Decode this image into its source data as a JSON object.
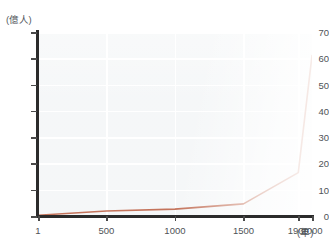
{
  "chart_data": {
    "type": "line",
    "title": "",
    "xlabel": "(年)",
    "ylabel": "(億人)",
    "xlim": [
      1,
      2000
    ],
    "ylim": [
      0,
      70
    ],
    "grid": true,
    "legend": "none",
    "x_ticks": [
      {
        "value": 1,
        "label": "1"
      },
      {
        "value": 500,
        "label": "500"
      },
      {
        "value": 1000,
        "label": "1000"
      },
      {
        "value": 1500,
        "label": "1500"
      },
      {
        "value": 1900,
        "label": "1900"
      },
      {
        "value": 2000,
        "label": "2000"
      }
    ],
    "y_ticks": [
      {
        "value": 0,
        "label": "0"
      },
      {
        "value": 10,
        "label": "10"
      },
      {
        "value": 20,
        "label": "20"
      },
      {
        "value": 30,
        "label": "30"
      },
      {
        "value": 40,
        "label": "40"
      },
      {
        "value": 50,
        "label": "50"
      },
      {
        "value": 60,
        "label": "60"
      },
      {
        "value": 70,
        "label": "70"
      }
    ],
    "series": [
      {
        "name": "世界人口",
        "color": "#c4745c",
        "x": [
          1,
          500,
          1000,
          1500,
          1900,
          2000
        ],
        "values": [
          0.3,
          1.9,
          2.6,
          4.6,
          16.5,
          61.0
        ]
      }
    ]
  },
  "axis": {
    "y_unit_caption": "(億人)",
    "x_unit_caption": "(年)"
  },
  "colors": {
    "line": "#c4745c",
    "plot_background": "#e9edf0",
    "gridline": "#ffffff",
    "axis": "#2b2b2b",
    "tick_text": "#4f5357"
  }
}
